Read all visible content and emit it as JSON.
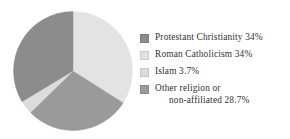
{
  "chart_data": {
    "type": "pie",
    "title": "",
    "subtitle": "",
    "xlabel": "",
    "ylabel": "",
    "grid": false,
    "legend_position": "right",
    "units": "percent",
    "start_angle_deg": 0,
    "direction": "clockwise",
    "categories": [
      "Protestant Christianity",
      "Roman Catholicism",
      "Islam",
      "Other religion or non-affiliated"
    ],
    "values": [
      34,
      34,
      3.7,
      28.7
    ],
    "value_labels": [
      "34%",
      "34%",
      "3.7%",
      "28.7%"
    ],
    "colors": [
      "#8c8c8c",
      "#e3e3e3",
      "#dcdcdc",
      "#9a9a9a"
    ],
    "slices": [
      {
        "label": "Roman Catholicism",
        "value": 34,
        "value_label": "34%",
        "color": "#e3e3e3",
        "start_deg": 0,
        "end_deg": 122.4
      },
      {
        "label": "Other religion or non-affiliated",
        "value": 28.7,
        "value_label": "28.7%",
        "color": "#9a9a9a",
        "start_deg": 122.4,
        "end_deg": 225.7
      },
      {
        "label": "Islam",
        "value": 3.7,
        "value_label": "3.7%",
        "color": "#dcdcdc",
        "start_deg": 225.7,
        "end_deg": 239.0
      },
      {
        "label": "Protestant Christianity",
        "value": 34,
        "value_label": "34%",
        "color": "#8c8c8c",
        "start_deg": 239.0,
        "end_deg": 360
      }
    ]
  },
  "legend": {
    "items": [
      {
        "label": "Protestant Christianity 34%",
        "label_line1": "Protestant Christianity 34%",
        "label_line2": "",
        "color": "#8c8c8c"
      },
      {
        "label": "Roman Catholicism 34%",
        "label_line1": "Roman Catholicism 34%",
        "label_line2": "",
        "color": "#e3e3e3"
      },
      {
        "label": "Islam 3.7%",
        "label_line1": "Islam 3.7%",
        "label_line2": "",
        "color": "#dcdcdc"
      },
      {
        "label": "Other religion or non-affiliated 28.7%",
        "label_line1": "Other religion or",
        "label_line2": "non-affiliated 28.7%",
        "color": "#9a9a9a"
      }
    ]
  }
}
